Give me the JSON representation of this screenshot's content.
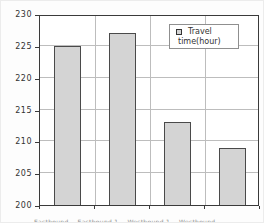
{
  "chart_data": {
    "type": "bar",
    "title": "",
    "categories": [
      "Eastbound",
      "Eastbound 1",
      "Westbound 1",
      "Westbound"
    ],
    "values": [
      225,
      227,
      213,
      209
    ],
    "xlabel": "",
    "ylabel": "",
    "ylim": [
      200,
      230
    ],
    "yticks": [
      200,
      205,
      210,
      215,
      220,
      225,
      230
    ],
    "grid": "horizontal and vertical category separators",
    "legend": {
      "position": "top-right-inside",
      "label_line1": "Travel",
      "label_line2": "time(hour)",
      "marker": "gray-square"
    }
  },
  "colors": {
    "background": "#fdfdfd",
    "bar_fill": "#d4d4d4",
    "bar_border": "#4a4a4a",
    "grid": "#bdbdbd",
    "plot_border": "#3a3a3a",
    "text": "#333333",
    "caption_text": "#8f8f8f"
  }
}
